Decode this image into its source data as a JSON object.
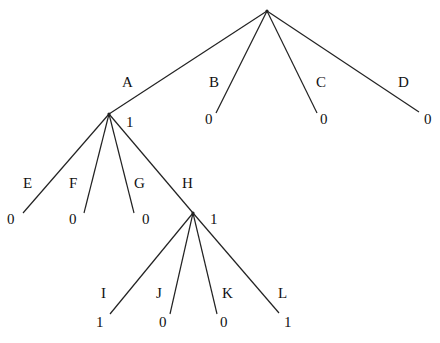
{
  "diagram": {
    "type": "game-tree",
    "colors": {
      "line": "#222222",
      "text": "#111111",
      "background": "#ffffff"
    },
    "root": {
      "id": "root",
      "x": 267,
      "y": 11
    },
    "nodes": [
      {
        "id": "A",
        "x": 109,
        "y": 114,
        "value": "1",
        "value_x": 126,
        "value_y": 127
      },
      {
        "id": "H",
        "x": 193,
        "y": 213,
        "value": "1",
        "value_x": 210,
        "value_y": 224
      }
    ],
    "edges": [
      {
        "from": "root",
        "label": "A",
        "x1": 267,
        "y1": 11,
        "x2": 109,
        "y2": 114,
        "label_x": 122,
        "label_y": 87,
        "leaf_value": null
      },
      {
        "from": "root",
        "label": "B",
        "x1": 267,
        "y1": 11,
        "x2": 216,
        "y2": 113,
        "label_x": 209,
        "label_y": 87,
        "leaf_value": "0",
        "value_x": 205,
        "value_y": 124
      },
      {
        "from": "root",
        "label": "C",
        "x1": 267,
        "y1": 11,
        "x2": 317,
        "y2": 113,
        "label_x": 316,
        "label_y": 87,
        "leaf_value": "0",
        "value_x": 320,
        "value_y": 124
      },
      {
        "from": "root",
        "label": "D",
        "x1": 267,
        "y1": 11,
        "x2": 419,
        "y2": 112,
        "label_x": 398,
        "label_y": 87,
        "leaf_value": "0",
        "value_x": 424,
        "value_y": 124
      },
      {
        "from": "A",
        "label": "E",
        "x1": 109,
        "y1": 114,
        "x2": 23,
        "y2": 213,
        "label_x": 23,
        "label_y": 188,
        "leaf_value": "0",
        "value_x": 7,
        "value_y": 224
      },
      {
        "from": "A",
        "label": "F",
        "x1": 109,
        "y1": 114,
        "x2": 84,
        "y2": 213,
        "label_x": 69,
        "label_y": 188,
        "leaf_value": "0",
        "value_x": 69,
        "value_y": 224
      },
      {
        "from": "A",
        "label": "G",
        "x1": 109,
        "y1": 114,
        "x2": 134,
        "y2": 213,
        "label_x": 134,
        "label_y": 188,
        "leaf_value": "0",
        "value_x": 142,
        "value_y": 224
      },
      {
        "from": "A",
        "label": "H",
        "x1": 109,
        "y1": 114,
        "x2": 193,
        "y2": 213,
        "label_x": 182,
        "label_y": 188,
        "leaf_value": null
      },
      {
        "from": "H",
        "label": "I",
        "x1": 193,
        "y1": 213,
        "x2": 110,
        "y2": 314,
        "label_x": 101,
        "label_y": 298,
        "leaf_value": "1",
        "value_x": 96,
        "value_y": 327
      },
      {
        "from": "H",
        "label": "J",
        "x1": 193,
        "y1": 213,
        "x2": 170,
        "y2": 314,
        "label_x": 156,
        "label_y": 298,
        "leaf_value": "0",
        "value_x": 159,
        "value_y": 327
      },
      {
        "from": "H",
        "label": "K",
        "x1": 193,
        "y1": 213,
        "x2": 217,
        "y2": 314,
        "label_x": 222,
        "label_y": 298,
        "leaf_value": "0",
        "value_x": 220,
        "value_y": 327
      },
      {
        "from": "H",
        "label": "L",
        "x1": 193,
        "y1": 213,
        "x2": 279,
        "y2": 313,
        "label_x": 278,
        "label_y": 298,
        "leaf_value": "1",
        "value_x": 284,
        "value_y": 327
      }
    ]
  }
}
